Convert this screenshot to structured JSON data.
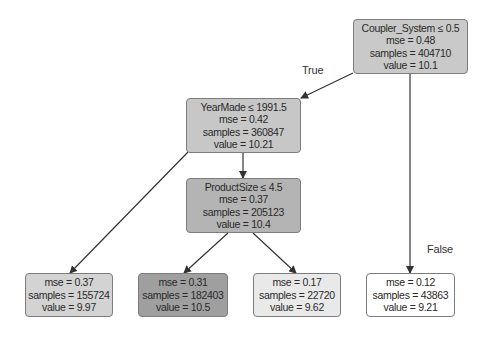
{
  "diagram": {
    "type": "decision-tree-regressor",
    "nodes": [
      {
        "id": "root",
        "condition": "Coupler_System ≤ 0.5",
        "mse": "mse = 0.48",
        "samples": "samples = 404710",
        "value": "value = 10.1",
        "fill": "#c9c9c9",
        "box": {
          "x": 353,
          "y": 19,
          "w": 115,
          "h": 55
        }
      },
      {
        "id": "yearmade",
        "condition": "YearMade ≤ 1991.5",
        "mse": "mse = 0.42",
        "samples": "samples = 360847",
        "value": "value = 10.21",
        "fill": "#c7c7c7",
        "box": {
          "x": 186,
          "y": 98,
          "w": 115,
          "h": 55
        }
      },
      {
        "id": "productsize",
        "condition": "ProductSize ≤ 4.5",
        "mse": "mse = 0.37",
        "samples": "samples = 205123",
        "value": "value = 10.4",
        "fill": "#b4b4b4",
        "box": {
          "x": 186,
          "y": 178,
          "w": 115,
          "h": 55
        }
      },
      {
        "id": "leaf1",
        "mse": "mse = 0.37",
        "samples": "samples = 155724",
        "value": "value = 9.97",
        "fill": "#d3d3d3",
        "box": {
          "x": 25,
          "y": 273,
          "w": 88,
          "h": 44
        }
      },
      {
        "id": "leaf2",
        "mse": "mse = 0.31",
        "samples": "samples = 182403",
        "value": "value = 10.5",
        "fill": "#9f9f9f",
        "box": {
          "x": 138,
          "y": 273,
          "w": 90,
          "h": 44
        }
      },
      {
        "id": "leaf3",
        "mse": "mse = 0.17",
        "samples": "samples = 22720",
        "value": "value = 9.62",
        "fill": "#e9e9e9",
        "box": {
          "x": 253,
          "y": 273,
          "w": 88,
          "h": 44
        }
      },
      {
        "id": "leaf4",
        "mse": "mse = 0.12",
        "samples": "samples = 43863",
        "value": "value = 9.21",
        "fill": "#ffffff",
        "box": {
          "x": 366,
          "y": 273,
          "w": 89,
          "h": 44
        }
      }
    ],
    "edges": [
      {
        "from": "root",
        "to": "yearmade",
        "x1": 353,
        "y1": 73,
        "x2": 301,
        "y2": 98
      },
      {
        "from": "root",
        "to": "leaf4",
        "x1": 410,
        "y1": 74,
        "x2": 410,
        "y2": 273
      },
      {
        "from": "yearmade",
        "to": "productsize",
        "x1": 243,
        "y1": 153,
        "x2": 243,
        "y2": 178
      },
      {
        "from": "yearmade",
        "to": "leaf1",
        "x1": 188,
        "y1": 152,
        "x2": 70,
        "y2": 273
      },
      {
        "from": "productsize",
        "to": "leaf2",
        "x1": 228,
        "y1": 233,
        "x2": 184,
        "y2": 273
      },
      {
        "from": "productsize",
        "to": "leaf3",
        "x1": 253,
        "y1": 233,
        "x2": 296,
        "y2": 273
      }
    ],
    "edge_labels": {
      "true_label": "True",
      "false_label": "False"
    },
    "colors": {
      "border": "#7c7c7c",
      "edge": "#333333",
      "text": "#2a2a2a"
    }
  }
}
